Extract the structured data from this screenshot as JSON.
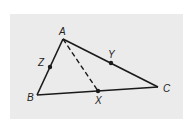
{
  "diagram": {
    "type": "triangle-median",
    "background_color": "#ebebeb",
    "stroke_color": "#1a1a1a",
    "vertices": {
      "A": {
        "label": "A",
        "x": 63,
        "y": 39
      },
      "B": {
        "label": "B",
        "x": 37,
        "y": 95
      },
      "C": {
        "label": "C",
        "x": 158,
        "y": 87
      }
    },
    "points": {
      "Z": {
        "label": "Z",
        "on_segment": "AB",
        "x": 50,
        "y": 67
      },
      "Y": {
        "label": "Y",
        "on_segment": "AC",
        "x": 111,
        "y": 63
      },
      "X": {
        "label": "X",
        "on_segment": "BC",
        "x": 98,
        "y": 91
      }
    },
    "segments": [
      {
        "from": "A",
        "to": "B",
        "style": "solid"
      },
      {
        "from": "B",
        "to": "C",
        "style": "solid"
      },
      {
        "from": "A",
        "to": "C",
        "style": "solid"
      },
      {
        "from": "A",
        "to": "X",
        "style": "dashed"
      }
    ]
  }
}
